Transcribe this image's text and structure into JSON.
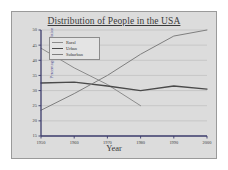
{
  "chart_data": {
    "type": "line",
    "title": "Distribution of People in the USA",
    "xlabel": "Year",
    "ylabel": "Percentage of the Population",
    "x": [
      1950,
      1960,
      1970,
      1980,
      1990,
      2000
    ],
    "xticklabels": [
      "1950",
      "1960",
      "1970",
      "1980",
      "1990",
      "2000"
    ],
    "yticklabels": [
      "15",
      "20",
      "25",
      "30",
      "35",
      "40",
      "45",
      "50"
    ],
    "yticks": [
      15,
      20,
      25,
      30,
      35,
      40,
      45,
      50
    ],
    "xlim": [
      1950,
      2000
    ],
    "ylim": [
      15,
      50
    ],
    "grid": true,
    "legend_position": "upper left",
    "series": [
      {
        "name": "Rural",
        "color": "#8c8c8c",
        "x": [
          1950,
          1960,
          1970,
          1980
        ],
        "values": [
          44,
          37.5,
          32,
          25
        ]
      },
      {
        "name": "Urban",
        "color": "#4a4a4a",
        "x": [
          1950,
          1960,
          1970,
          1980,
          1990,
          2000
        ],
        "values": [
          32.5,
          32.8,
          31.5,
          30,
          31.5,
          30.5
        ]
      },
      {
        "name": "Suburban",
        "color": "#7f7f7f",
        "x": [
          1950,
          1960,
          1970,
          1980,
          1990,
          2000
        ],
        "values": [
          23.5,
          29,
          35,
          42,
          48,
          50
        ]
      }
    ]
  },
  "figure": {
    "panel_color": "#dcdcdc",
    "border_color": "#9a9a9a",
    "axis_color": "#3b3b6b",
    "grid_color": "#bdbdbd",
    "title_color": "#3a3a3a",
    "ylabel_color": "#4b4b90"
  }
}
